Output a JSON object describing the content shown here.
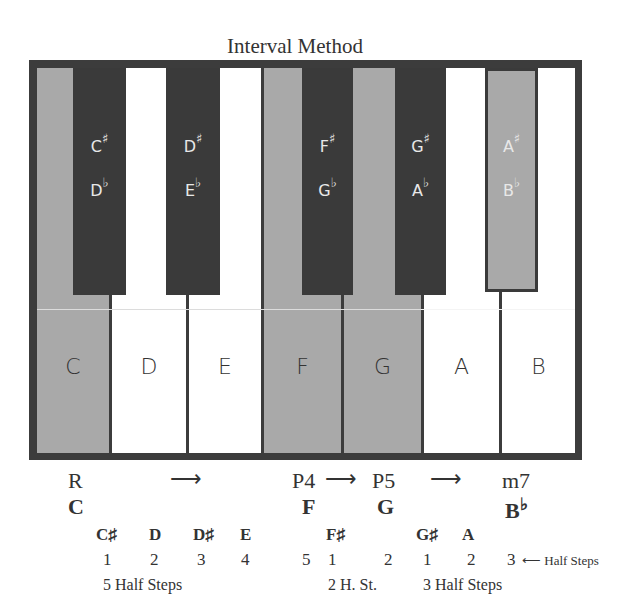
{
  "title": "Interval Method",
  "colors": {
    "frame": "#3c3c3c",
    "highlight_key": "#a9a9a9",
    "white_key": "#ffffff",
    "black_key": "#3a3a3a"
  },
  "white_keys": [
    {
      "label": "C",
      "highlighted": true
    },
    {
      "label": "D",
      "highlighted": false
    },
    {
      "label": "E",
      "highlighted": false
    },
    {
      "label": "F",
      "highlighted": true
    },
    {
      "label": "G",
      "highlighted": true
    },
    {
      "label": "A",
      "highlighted": false
    },
    {
      "label": "B",
      "highlighted": false
    }
  ],
  "black_keys": [
    {
      "sharp": "C",
      "flat": "D",
      "highlighted": false
    },
    {
      "sharp": "D",
      "flat": "E",
      "highlighted": false
    },
    {
      "sharp": "F",
      "flat": "G",
      "highlighted": false
    },
    {
      "sharp": "G",
      "flat": "A",
      "highlighted": false
    },
    {
      "sharp": "A",
      "flat": "B",
      "highlighted": true
    }
  ],
  "symbols": {
    "sharp": "♯",
    "flat": "♭",
    "arrow_right": "⟶",
    "arrow_left": "⟵"
  },
  "intervals": {
    "root": "R",
    "p4": "P4",
    "p5": "P5",
    "m7": "m7"
  },
  "chord_notes": {
    "root": "C",
    "p4": "F",
    "p5": "G",
    "m7": "B"
  },
  "passing_notes": [
    "C♯",
    "D",
    "D♯",
    "E",
    "F♯",
    "G♯",
    "A"
  ],
  "counts": [
    "1",
    "2",
    "3",
    "4",
    "5",
    "1",
    "2",
    "1",
    "2",
    "3"
  ],
  "half_steps_label": "Half Steps",
  "group_labels": [
    "5 Half Steps",
    "2 H. St.",
    "3 Half Steps"
  ]
}
